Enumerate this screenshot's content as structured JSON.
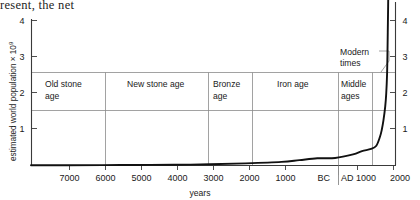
{
  "page": {
    "running_text_fragment": "resent, the net"
  },
  "chart_data": {
    "type": "line",
    "title": "",
    "xlabel": "years",
    "ylabel": "estimated world population × 10",
    "ylabel_exponent": "9",
    "ylim": [
      0,
      4.6
    ],
    "xlim": [
      -8000,
      2200
    ],
    "grid": false,
    "legend_position": "none",
    "y_ticks": [
      1,
      2,
      3,
      4
    ],
    "y_tick_labels": [
      "1",
      "2",
      "3",
      "4"
    ],
    "y_axis_right": true,
    "y_ticks_right": [
      1,
      2,
      3,
      4
    ],
    "y_tick_labels_right": [
      "1",
      "2",
      "3",
      "4"
    ],
    "x_ticks": [
      -7000,
      -6000,
      -5000,
      -4000,
      -3000,
      -2000,
      -1000,
      0,
      1000,
      2000
    ],
    "x_tick_labels": [
      "7000",
      "6000",
      "5000",
      "4000",
      "3000",
      "2000",
      "1000",
      "BC|AD",
      "1000",
      "2000"
    ],
    "era_divider_label": "BC",
    "era_divider_label2": "AD",
    "series": [
      {
        "name": "estimated world population",
        "x": [
          -8000,
          -7000,
          -6000,
          -5000,
          -4000,
          -3000,
          -2000,
          -1000,
          -500,
          0,
          500,
          1000,
          1250,
          1500,
          1650,
          1750,
          1800,
          1850,
          1900,
          1927,
          1950,
          1960,
          1970,
          1975,
          1980,
          1987
        ],
        "values": [
          0.005,
          0.007,
          0.01,
          0.015,
          0.02,
          0.035,
          0.06,
          0.1,
          0.15,
          0.2,
          0.21,
          0.31,
          0.4,
          0.46,
          0.55,
          0.79,
          0.98,
          1.26,
          1.65,
          2.0,
          2.52,
          3.02,
          3.7,
          4.07,
          4.43,
          5.0
        ]
      }
    ],
    "bands": [
      {
        "label_line1": "Old stone",
        "label_line2": "age",
        "start": -8000,
        "end": -6000
      },
      {
        "label_line1": "New stone age",
        "label_line2": "",
        "start": -6000,
        "end": -3000
      },
      {
        "label_line1": "Bronze",
        "label_line2": "age",
        "start": -3000,
        "end": -2000
      },
      {
        "label_line1": "Iron age",
        "label_line2": "",
        "start": -2000,
        "end": 0
      },
      {
        "label_line1": "Middle",
        "label_line2": "ages",
        "start": 0,
        "end": 1000
      },
      {
        "label_line1": "",
        "label_line2": "",
        "start": 1000,
        "end": 2200
      }
    ],
    "annotations": [
      {
        "label_line1": "Modern",
        "label_line2": "times",
        "target_band_index": 5
      }
    ]
  }
}
